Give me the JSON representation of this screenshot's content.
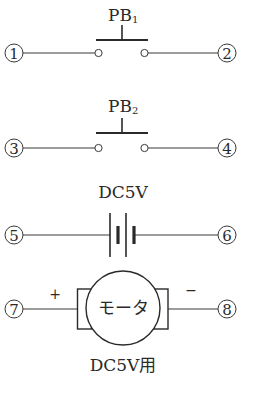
{
  "components": {
    "pb1": {
      "label": "PB",
      "subscript": "1",
      "terminal_left": "1",
      "terminal_right": "2"
    },
    "pb2": {
      "label": "PB",
      "subscript": "2",
      "terminal_left": "3",
      "terminal_right": "4"
    },
    "battery": {
      "label": "DC5V",
      "terminal_left": "5",
      "terminal_right": "6"
    },
    "motor": {
      "name": "モータ",
      "rating": "DC5V用",
      "plus_sign": "+",
      "minus_sign": "−",
      "terminal_left": "7",
      "terminal_right": "8"
    }
  },
  "colors": {
    "line": "#3a3a3a",
    "text": "#2a2a2a",
    "background": "#ffffff"
  }
}
